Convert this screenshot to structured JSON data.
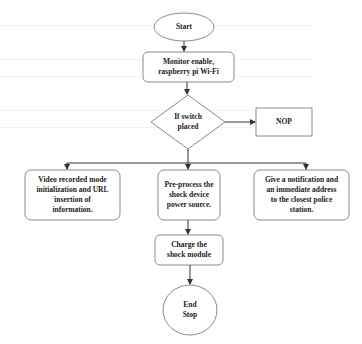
{
  "figure": {
    "type": "flowchart",
    "nodes": {
      "start": {
        "label": "Start",
        "shape": "ellipse"
      },
      "monitor": {
        "label": "Monitor enable, raspberry pi Wi-Fi",
        "line1": "Monitor enable,",
        "line2": "raspberry pi Wi-Fi",
        "shape": "rounded-rect"
      },
      "decision": {
        "label": "If switch placed",
        "line1": "If switch",
        "line2": "placed",
        "shape": "diamond"
      },
      "nop": {
        "label": "NOP",
        "shape": "rect"
      },
      "video": {
        "label": "Video recorded mode initialization and URL insertion of information.",
        "line1": "Video recorded mode",
        "line2": "initialization and URL",
        "line3": "insertion of",
        "line4": "information.",
        "shape": "rounded-rect"
      },
      "preprocess": {
        "label": "Pre-process the shock device power source.",
        "line1": "Pre-process the",
        "line2": "shock device",
        "line3": "power source.",
        "shape": "rounded-rect"
      },
      "notify": {
        "label": "Give a notification and an immediate address to the closest police station.",
        "line1": "Give a notification and",
        "line2": "an immediate address",
        "line3": "to the closest police",
        "line4": "station.",
        "shape": "rounded-rect"
      },
      "charge": {
        "label": "Charge the shock module",
        "line1": "Charge the",
        "line2": "shock module",
        "shape": "rounded-rect"
      },
      "end": {
        "label": "End Stop",
        "line1": "End",
        "line2": "Stop",
        "shape": "ellipse"
      }
    },
    "edges": [
      [
        "start",
        "monitor"
      ],
      [
        "monitor",
        "decision"
      ],
      [
        "decision",
        "nop"
      ],
      [
        "decision",
        "video"
      ],
      [
        "decision",
        "preprocess"
      ],
      [
        "decision",
        "notify"
      ],
      [
        "preprocess",
        "charge"
      ],
      [
        "charge",
        "end"
      ]
    ]
  },
  "colors": {
    "stroke": "#8a8a8a",
    "arrow": "#333333",
    "text": "#222222",
    "background": "#ffffff"
  }
}
